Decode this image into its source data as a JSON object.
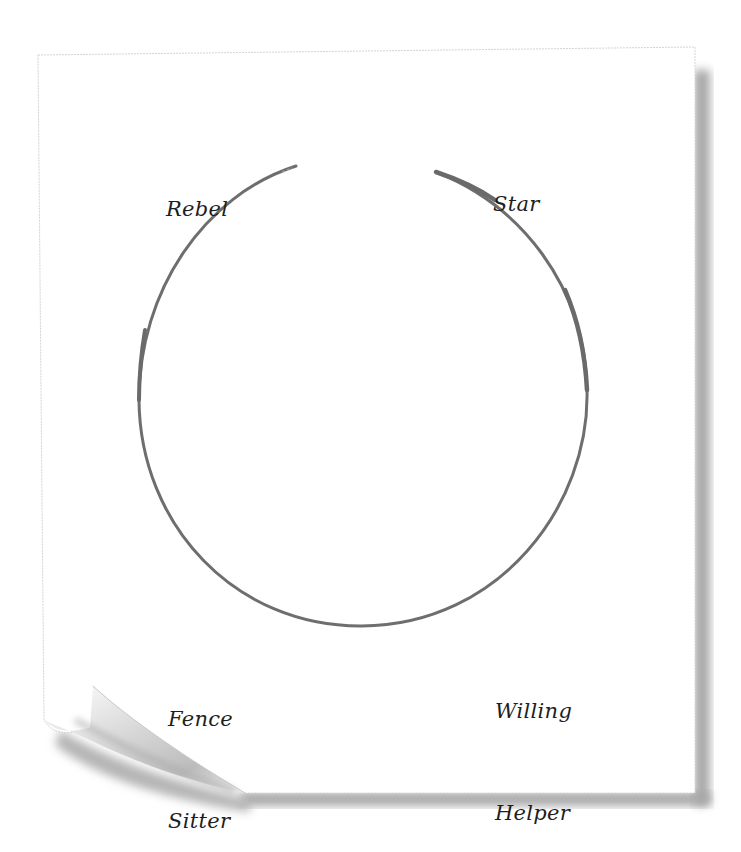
{
  "diagram": {
    "type": "circle-quadrant",
    "labels": {
      "top_left": {
        "lines": [
          "Rebel"
        ]
      },
      "top_right": {
        "lines": [
          "Star"
        ]
      },
      "bottom_left": {
        "lines": [
          "Fence",
          "Sitter"
        ]
      },
      "bottom_right": {
        "lines": [
          "Willing",
          "Helper"
        ]
      }
    },
    "circle": {
      "center_x": 363,
      "center_y": 399,
      "radius": 226,
      "gap_position": "top",
      "stroke_color": "#6e6e6e"
    },
    "colors": {
      "paper": "#ffffff",
      "paper_edge": "#cfcfcf",
      "shadow": "#9a9a9a",
      "text": "#1e1e1e"
    }
  }
}
